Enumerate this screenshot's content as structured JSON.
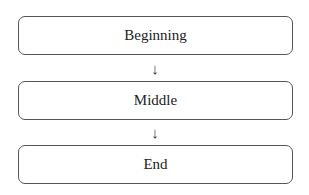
{
  "diagram": {
    "type": "flowchart",
    "direction": "top-to-bottom",
    "nodes": [
      {
        "id": "beginning",
        "label": "Beginning"
      },
      {
        "id": "middle",
        "label": "Middle"
      },
      {
        "id": "end",
        "label": "End"
      }
    ],
    "edges": [
      {
        "from": "beginning",
        "to": "middle",
        "glyph": "↓"
      },
      {
        "from": "middle",
        "to": "end",
        "glyph": "↓"
      }
    ]
  }
}
